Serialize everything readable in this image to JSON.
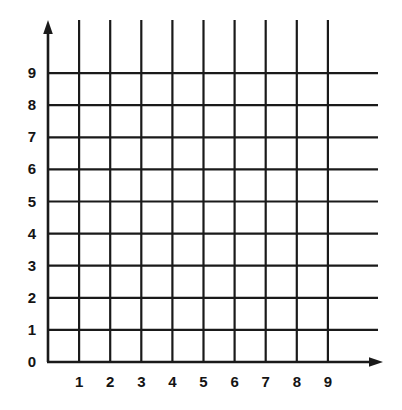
{
  "chart_data": {
    "type": "grid",
    "title": "",
    "subtitle": "",
    "xlabel": "",
    "ylabel": "",
    "x_tick_labels": [
      "1",
      "2",
      "3",
      "4",
      "5",
      "6",
      "7",
      "8",
      "9"
    ],
    "y_tick_labels": [
      "0",
      "1",
      "2",
      "3",
      "4",
      "5",
      "6",
      "7",
      "8",
      "9"
    ],
    "x_values": [
      1,
      2,
      3,
      4,
      5,
      6,
      7,
      8,
      9
    ],
    "y_values": [
      0,
      1,
      2,
      3,
      4,
      5,
      6,
      7,
      8,
      9
    ],
    "xlim": [
      0,
      9
    ],
    "ylim": [
      0,
      9
    ],
    "grid": true,
    "grid_lines_x": 9,
    "grid_lines_y": 9,
    "legend": null,
    "series": [],
    "annotations": [],
    "axes": {
      "x_axis_arrow": true,
      "y_axis_arrow": true,
      "origin_label": "0"
    },
    "colors": {
      "line": "#1a1a1a",
      "grid": "#1a1a1a",
      "background": "#ffffff",
      "text": "#141414"
    }
  },
  "geometry": {
    "origin_x": 48,
    "origin_y": 362,
    "step_x": 31.1,
    "step_y": 32.1,
    "grid_top": 20,
    "grid_right": 378,
    "x_axis_arrow_tip": 383,
    "y_axis_arrow_tip": 20
  }
}
